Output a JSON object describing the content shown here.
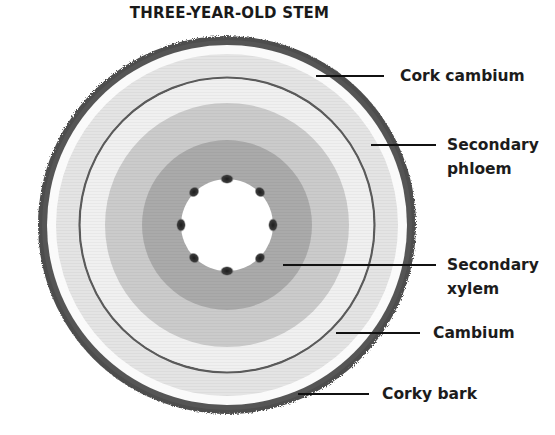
{
  "title": "THREE-YEAR-OLD STEM",
  "labels": {
    "cork_cambium": "Cork cambium",
    "secondary_phloem": [
      "Secondary",
      "phloem"
    ],
    "secondary_xylem": [
      "Secondary",
      "xylem"
    ],
    "cambium": "Cambium",
    "corky_bark": "Corky bark"
  },
  "colors": {
    "bark": "#4a4a4a",
    "phloem_band": "#e3e3e3",
    "cambium_line": "#5a5a5a",
    "outer_xylem": "#c8c8c8",
    "inner_xylem": "#a9a9a9",
    "pith": "#ffffff",
    "vascular_bundle": "#2a2a2a",
    "leader_line": "#111111"
  },
  "geometry": {
    "center": [
      227,
      225
    ],
    "bark_outer_radius": 189,
    "bark_inner_radius": 180,
    "phloem_outer_radius": 171,
    "cambium_radius": 147,
    "outer_xylem_radius": 122,
    "inner_xylem_radius": 85,
    "pith_radius": 46,
    "pith_bundles": 8
  }
}
